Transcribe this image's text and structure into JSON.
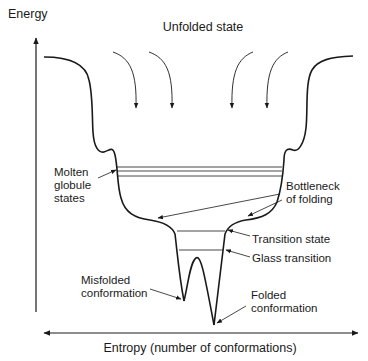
{
  "diagram": {
    "y_axis": {
      "label": "Energy"
    },
    "x_axis": {
      "label": "Entropy (number of conformations)"
    },
    "top_label": "Unfolded state",
    "annotations": {
      "molten_globule": [
        "Molten",
        "globule",
        "states"
      ],
      "bottleneck": [
        "Bottleneck",
        "of folding"
      ],
      "transition_state": "Transition state",
      "glass_transition": "Glass transition",
      "misfolded": [
        "Misfolded",
        "conformation"
      ],
      "folded": [
        "Folded",
        "conformation"
      ]
    },
    "colors": {
      "line": "#1a1a1a",
      "background": "#ffffff"
    }
  }
}
